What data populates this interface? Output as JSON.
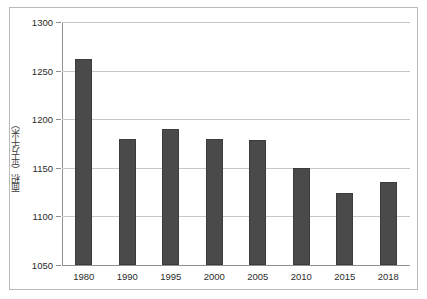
{
  "chart_data": {
    "type": "bar",
    "title": "",
    "xlabel": "",
    "ylabel": "面积（平方千米）",
    "categories": [
      "1980",
      "1990",
      "1995",
      "2000",
      "2005",
      "2010",
      "2015",
      "2018"
    ],
    "values": [
      1262,
      1180,
      1190,
      1180,
      1179,
      1150,
      1124,
      1135
    ],
    "ylim": [
      1050,
      1300
    ],
    "ytick_labels": [
      "1050",
      "1100",
      "1150",
      "1200",
      "1250",
      "1300"
    ],
    "ytick_values": [
      1050,
      1100,
      1150,
      1200,
      1250,
      1300
    ],
    "grid": true,
    "legend": null,
    "bar_color": "#4a4a4a",
    "grid_color": "#c8c8c8",
    "axis_color": "#8f8f8f",
    "background_color": "#ffffff",
    "border_color": "#b9b9b9"
  }
}
